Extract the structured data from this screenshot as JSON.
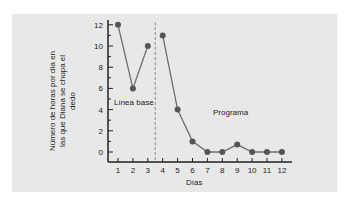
{
  "chart_data": {
    "type": "line",
    "title": "",
    "xlabel": "Días",
    "ylabel": "Número de horas por día en las que Diana se chupa el dedo",
    "x": [
      1,
      2,
      3,
      4,
      5,
      6,
      7,
      8,
      9,
      10,
      11,
      12
    ],
    "series": [
      {
        "name": "Línea base",
        "x": [
          1,
          2,
          3
        ],
        "values": [
          12,
          6,
          10
        ]
      },
      {
        "name": "Programa",
        "x": [
          4,
          5,
          6,
          7,
          8,
          9,
          10,
          11,
          12
        ],
        "values": [
          11,
          4,
          1,
          0,
          0,
          0.7,
          0,
          0,
          0
        ]
      }
    ],
    "xticks": [
      "1",
      "2",
      "3",
      "4",
      "5",
      "6",
      "7",
      "8",
      "9",
      "10",
      "11",
      "12"
    ],
    "yticks": [
      "0",
      "2",
      "4",
      "6",
      "8",
      "10",
      "12"
    ],
    "ylim": [
      0,
      12
    ],
    "phase_divider_x": 3.5,
    "annotations": [
      "Línea base",
      "Programa"
    ],
    "grid": false,
    "colors": {
      "line": "#6e6e6e",
      "marker": "#555555",
      "background": "#e8e8e8",
      "divider": "#888888"
    }
  },
  "labels": {
    "xlabel": "Días",
    "ylabel": "Número de horas por día en las que Diana se chupa el dedo",
    "baseline": "Línea base",
    "program": "Programa"
  }
}
